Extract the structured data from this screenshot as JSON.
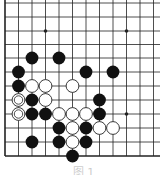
{
  "diagram": {
    "type": "go-board-fragment",
    "colors": {
      "line": "#222222",
      "black_stone": "#111111",
      "white_stone": "#ffffff",
      "background": "#ffffff"
    },
    "grid": {
      "columns_x": [
        5,
        18.5,
        32,
        45.5,
        59,
        72.5,
        86,
        99.5,
        113,
        126.5,
        140,
        153.5
      ],
      "rows_y": [
        3,
        17,
        31,
        44.5,
        58,
        72,
        86,
        100,
        114,
        128,
        142,
        156
      ],
      "left_edge": true,
      "bottom_edge": true
    },
    "star_points": [
      [
        3,
        2
      ],
      [
        9,
        2
      ],
      [
        9,
        8
      ]
    ],
    "stones": [
      {
        "col": 2,
        "row": 4,
        "color": "black"
      },
      {
        "col": 4,
        "row": 4,
        "color": "black"
      },
      {
        "col": 1,
        "row": 5,
        "color": "black"
      },
      {
        "col": 6,
        "row": 5,
        "color": "black"
      },
      {
        "col": 8,
        "row": 5,
        "color": "black"
      },
      {
        "col": 1,
        "row": 6,
        "color": "black"
      },
      {
        "col": 2,
        "row": 6,
        "color": "white"
      },
      {
        "col": 3,
        "row": 6,
        "color": "white"
      },
      {
        "col": 5,
        "row": 6,
        "color": "white"
      },
      {
        "col": 1,
        "row": 7,
        "color": "white",
        "marked": true
      },
      {
        "col": 2,
        "row": 7,
        "color": "black"
      },
      {
        "col": 3,
        "row": 7,
        "color": "white"
      },
      {
        "col": 7,
        "row": 7,
        "color": "black"
      },
      {
        "col": 1,
        "row": 8,
        "color": "white",
        "marked": true
      },
      {
        "col": 2,
        "row": 8,
        "color": "black"
      },
      {
        "col": 3,
        "row": 8,
        "color": "black"
      },
      {
        "col": 4,
        "row": 8,
        "color": "white"
      },
      {
        "col": 5,
        "row": 8,
        "color": "white"
      },
      {
        "col": 6,
        "row": 8,
        "color": "white"
      },
      {
        "col": 7,
        "row": 8,
        "color": "black"
      },
      {
        "col": 4,
        "row": 9,
        "color": "black"
      },
      {
        "col": 5,
        "row": 9,
        "color": "white"
      },
      {
        "col": 6,
        "row": 9,
        "color": "black"
      },
      {
        "col": 7,
        "row": 9,
        "color": "white"
      },
      {
        "col": 8,
        "row": 9,
        "color": "white"
      },
      {
        "col": 2,
        "row": 10,
        "color": "black"
      },
      {
        "col": 4,
        "row": 10,
        "color": "black"
      },
      {
        "col": 5,
        "row": 10,
        "color": "white"
      },
      {
        "col": 6,
        "row": 10,
        "color": "black"
      },
      {
        "col": 5,
        "row": 11,
        "color": "black"
      }
    ],
    "stone_radius": 6.4,
    "caption": "图 1"
  }
}
